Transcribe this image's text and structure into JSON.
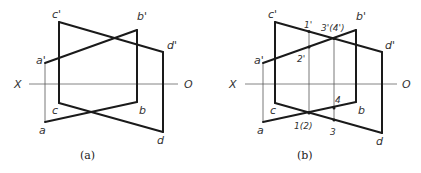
{
  "figure": {
    "panels": [
      {
        "id": "a",
        "caption": "(a)",
        "axis": {
          "left_label": "X",
          "right_label": "O"
        },
        "points": {
          "c_prime": "c'",
          "b_prime": "b'",
          "d_prime": "d'",
          "a_prime": "a'",
          "c": "c",
          "b": "b",
          "a": "a",
          "d": "d"
        }
      },
      {
        "id": "b",
        "caption": "(b)",
        "axis": {
          "left_label": "X",
          "right_label": "O"
        },
        "points": {
          "c_prime": "c'",
          "b_prime": "b'",
          "d_prime": "d'",
          "a_prime": "a'",
          "c": "c",
          "b": "b",
          "a": "a",
          "d": "d"
        },
        "intersection_labels": {
          "p1_prime": "1'",
          "p2_prime": "2'",
          "p34_prime": "3'(4')",
          "p12": "1(2)",
          "p4": "4",
          "p3": "3"
        }
      }
    ],
    "colors": {
      "line": "#1a1a1a",
      "thin_line": "#555555",
      "text": "#333333"
    }
  }
}
